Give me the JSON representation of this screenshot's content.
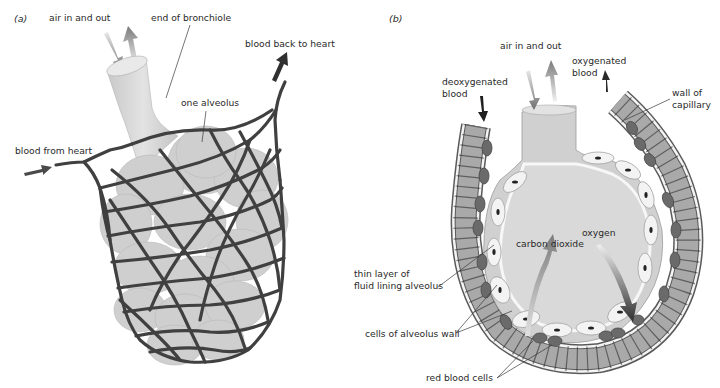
{
  "figure": {
    "panels": [
      {
        "id": "a",
        "label": "(a)",
        "labels": {
          "air": "air in and out",
          "bronchiole": "end of bronchiole",
          "blood_back": "blood back to heart",
          "alveolus": "one alveolus",
          "blood_from": "blood from heart"
        }
      },
      {
        "id": "b",
        "label": "(b)",
        "labels": {
          "air": "air in and out",
          "oxy_line1": "oxygenated",
          "oxy_line2": "blood",
          "deoxy_line1": "deoxygenated",
          "deoxy_line2": "blood",
          "wall_line1": "wall of",
          "wall_line2": "capillary",
          "oxygen": "oxygen",
          "co2": "carbon dioxide",
          "fluid_line1": "thin layer of",
          "fluid_line2": "fluid lining alveolus",
          "cells_wall": "cells of alveolus wall",
          "rbc": "red blood cells"
        }
      }
    ]
  },
  "colors": {
    "vessel": "#404040",
    "alveolus_fill": "#cfcfcf",
    "alveolus_inner": "#d6d6d6",
    "capillary_fill": "#a9a9a9",
    "red_blood_cell": "#6a6a6a",
    "arrow_dark": "#2a2a2a",
    "arrow_mid": "#7a7a7a"
  }
}
